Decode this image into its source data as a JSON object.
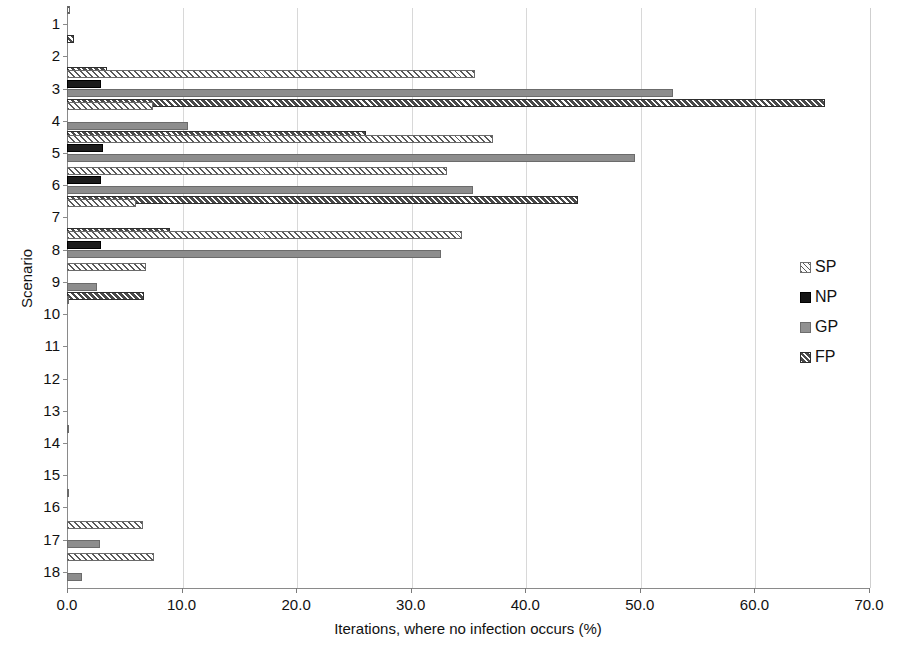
{
  "chart_data": {
    "type": "bar",
    "orientation": "horizontal",
    "title": "",
    "xlabel": "Iterations, where no infection occurs (%)",
    "ylabel": "Scenario",
    "xlim": [
      0,
      70
    ],
    "xticks": [
      "0.0",
      "10.0",
      "20.0",
      "30.0",
      "40.0",
      "50.0",
      "60.0",
      "70.0"
    ],
    "categories": [
      "1",
      "2",
      "3",
      "4",
      "5",
      "6",
      "7",
      "8",
      "9",
      "10",
      "11",
      "12",
      "13",
      "14",
      "15",
      "16",
      "17",
      "18"
    ],
    "grid": "vertical",
    "legend_position": "right",
    "series": [
      {
        "name": "SP",
        "color": "#fdfdfd",
        "pattern": "light-diagonal-hatch",
        "values": [
          0.25,
          0,
          35.6,
          7.5,
          37.2,
          33.2,
          6.0,
          34.5,
          6.9,
          0.2,
          0,
          0,
          0,
          0.2,
          0,
          0.2,
          6.6,
          7.6
        ]
      },
      {
        "name": "NP",
        "color": "#1c1c1c",
        "pattern": "solid-black",
        "values": [
          0,
          0,
          3.0,
          0,
          3.1,
          3.0,
          0,
          3.0,
          0,
          0,
          0,
          0,
          0,
          0,
          0,
          0,
          0,
          0
        ]
      },
      {
        "name": "GP",
        "color": "#8d8d8d",
        "pattern": "solid-gray",
        "values": [
          0,
          0,
          52.9,
          10.6,
          49.6,
          35.4,
          0,
          32.6,
          2.6,
          0,
          0,
          0,
          0,
          0,
          0,
          0,
          2.9,
          1.3
        ]
      },
      {
        "name": "FP",
        "color": "#4a4a4a",
        "pattern": "dark-diagonal-hatch",
        "values": [
          0.6,
          3.5,
          66.2,
          26.1,
          0,
          44.6,
          9.0,
          0,
          6.7,
          0,
          0,
          0,
          0,
          0,
          0,
          0,
          0,
          0
        ]
      }
    ]
  }
}
